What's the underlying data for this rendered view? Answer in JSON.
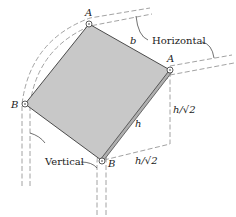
{
  "diagram": {
    "labels": {
      "a_top": "A",
      "a_right": "A",
      "b_left": "B",
      "b_bottom": "B",
      "side_b": "b",
      "side_h": "h",
      "vertical_offset": "h/√2",
      "horizontal_offset": "h/√2",
      "horizontal": "Horizontal",
      "vertical": "Vertical"
    },
    "colors": {
      "plate_fill": "#c8c8c8",
      "plate_stroke": "#3a3a3a",
      "guide_dash": "#8a8a8a"
    }
  }
}
